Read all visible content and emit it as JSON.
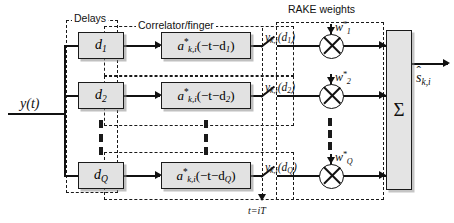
{
  "diagram": {
    "input_signal": "y(t)",
    "output_signal": "s",
    "output_sub": "k,i",
    "sampling_label": "t=iT",
    "summation_symbol": "Σ",
    "group_labels": {
      "delays": "Delays",
      "correlator": "Correlator/finger",
      "rake_weights": "RAKE weights"
    },
    "branches": [
      {
        "delay_label": "d",
        "delay_sub": "1",
        "correlator_prefix": "a",
        "correlator_sub": "k,i",
        "correlator_arg": "(−t−d",
        "correlator_arg_sub": "1",
        "correlator_arg_close": ")",
        "output_label": "y",
        "output_sub": "k,i",
        "output_arg": "(d",
        "output_arg_sub": "1",
        "output_arg_close": ")",
        "weight_label": "w",
        "weight_sub": "1"
      },
      {
        "delay_label": "d",
        "delay_sub": "2",
        "correlator_prefix": "a",
        "correlator_sub": "k,i",
        "correlator_arg": "(−t−d",
        "correlator_arg_sub": "2",
        "correlator_arg_close": ")",
        "output_label": "y",
        "output_sub": "k,i",
        "output_arg": "(d",
        "output_arg_sub": "2",
        "output_arg_close": ")",
        "weight_label": "w",
        "weight_sub": "2"
      },
      {
        "delay_label": "d",
        "delay_sub": "Q",
        "correlator_prefix": "a",
        "correlator_sub": "k,i",
        "correlator_arg": "(−t−d",
        "correlator_arg_sub": "Q",
        "correlator_arg_close": ")",
        "output_label": "y",
        "output_sub": "k,i",
        "output_arg": "(d",
        "output_arg_sub": "Q",
        "output_arg_close": ")",
        "weight_label": "w",
        "weight_sub": "Q"
      }
    ],
    "conjugate_marker": "*",
    "colors": {
      "line": "#111111",
      "box_fill": "#e2e2e2",
      "background": "#ffffff"
    }
  }
}
